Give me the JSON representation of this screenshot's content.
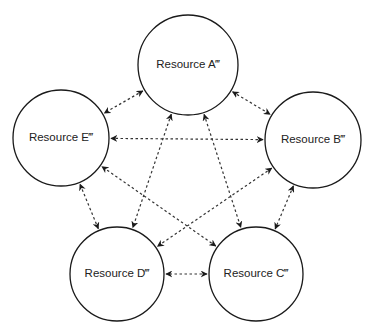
{
  "diagram": {
    "type": "network",
    "nodes": [
      {
        "id": "A",
        "label": "Resource A‴"
      },
      {
        "id": "B",
        "label": "Resource B‴"
      },
      {
        "id": "C",
        "label": "Resource C‴"
      },
      {
        "id": "D",
        "label": "Resource D‴"
      },
      {
        "id": "E",
        "label": "Resource E‴"
      }
    ],
    "edges": [
      {
        "from": "A",
        "to": "B",
        "style": "dashed",
        "direction": "both"
      },
      {
        "from": "A",
        "to": "C",
        "style": "dashed",
        "direction": "both"
      },
      {
        "from": "A",
        "to": "D",
        "style": "dashed",
        "direction": "both"
      },
      {
        "from": "A",
        "to": "E",
        "style": "dashed",
        "direction": "both"
      },
      {
        "from": "B",
        "to": "C",
        "style": "dashed",
        "direction": "both"
      },
      {
        "from": "B",
        "to": "D",
        "style": "dashed",
        "direction": "both"
      },
      {
        "from": "B",
        "to": "E",
        "style": "dashed",
        "direction": "both"
      },
      {
        "from": "C",
        "to": "D",
        "style": "dashed",
        "direction": "both"
      },
      {
        "from": "C",
        "to": "E",
        "style": "dashed",
        "direction": "both"
      },
      {
        "from": "D",
        "to": "E",
        "style": "dashed",
        "direction": "both"
      }
    ],
    "colors": {
      "stroke": "#1a1a1a",
      "background": "#ffffff"
    }
  }
}
